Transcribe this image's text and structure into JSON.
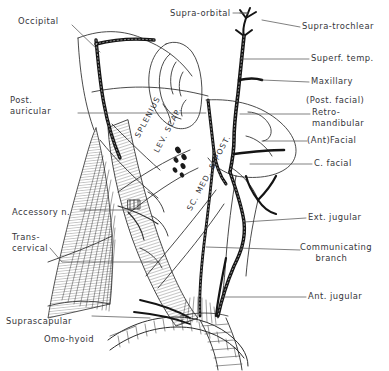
{
  "figure": {
    "background_color": "#ffffff",
    "ink_color": "#2b2b2b",
    "label_color": "#35353a"
  },
  "labels": {
    "left": [
      {
        "id": "occipital",
        "text": "Occipital",
        "x": 18,
        "y": 16
      },
      {
        "id": "post-auricular",
        "text": "Post.\nauricular",
        "x": 10,
        "y": 95
      },
      {
        "id": "accessory-n",
        "text": "Accessory n.",
        "x": 12,
        "y": 207
      },
      {
        "id": "transcervical",
        "text": "Trans-\ncervical",
        "x": 12,
        "y": 232
      },
      {
        "id": "suprascapular",
        "text": "Suprascapular",
        "x": 6,
        "y": 316
      },
      {
        "id": "omo-hyoid",
        "text": "Omo-hyoid",
        "x": 44,
        "y": 334
      }
    ],
    "top": [
      {
        "id": "supra-orbital",
        "text": "Supra-orbital",
        "x": 170,
        "y": 11
      }
    ],
    "right": [
      {
        "id": "supra-trochlear",
        "text": "Supra-trochlear",
        "x": 302,
        "y": 24
      },
      {
        "id": "superf-temp",
        "text": "Superf. temp.",
        "x": 311,
        "y": 56
      },
      {
        "id": "maxillary",
        "text": "Maxillary",
        "x": 311,
        "y": 79
      },
      {
        "id": "post-facial",
        "text": "(Post. facial)",
        "x": 308,
        "y": 99
      },
      {
        "id": "retromandibular",
        "text": "Retro-\nmandibular",
        "x": 312,
        "y": 111
      },
      {
        "id": "ant-facial",
        "text": "(Ant)Facial",
        "x": 309,
        "y": 138
      },
      {
        "id": "c-facial",
        "text": "C. facial",
        "x": 314,
        "y": 161
      },
      {
        "id": "ext-jugular",
        "text": "Ext. jugular",
        "x": 308,
        "y": 215
      },
      {
        "id": "communicating-branch",
        "text": "Communicating\n     branch",
        "x": 302,
        "y": 245
      },
      {
        "id": "ant-jugular",
        "text": "Ant. jugular",
        "x": 308,
        "y": 294
      }
    ],
    "muscles": [
      {
        "id": "splenius",
        "text": "SPLENIUS",
        "x": 133,
        "y": 135,
        "rotate": -62
      },
      {
        "id": "lev-scap",
        "text": "LEV. SCAP.",
        "x": 152,
        "y": 150,
        "rotate": -62
      },
      {
        "id": "sc-med-post",
        "text": "SC. MED. & POST.",
        "x": 185,
        "y": 208,
        "rotate": -62
      }
    ]
  },
  "leaders": {
    "description": "Thin leader lines linking each label to its anatomical structure"
  }
}
